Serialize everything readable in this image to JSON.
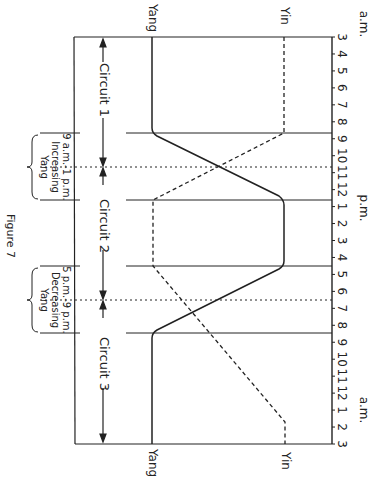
{
  "figure": {
    "caption": "Figure 7",
    "series": {
      "yang_label": "Yang",
      "yin_label": "Yin"
    },
    "axis": {
      "start_period": "a.m.",
      "mid_period": "p.m.",
      "end_period": "a.m.",
      "hour_ticks": [
        "3",
        "4",
        "5",
        "6",
        "7",
        "8",
        "9",
        "10",
        "11",
        "12",
        "1",
        "2",
        "3",
        "4",
        "5",
        "6",
        "7",
        "8",
        "9",
        "10",
        "11",
        "12",
        "1",
        "2",
        "3"
      ]
    },
    "circuits": [
      {
        "label": "Circuit 1",
        "from": "3 a.m.",
        "to": "11 a.m."
      },
      {
        "label": "Circuit 2",
        "from": "11 a.m.",
        "to": "7 p.m."
      },
      {
        "label": "Circuit 3",
        "from": "7 p.m.",
        "to": "3 a.m."
      }
    ],
    "transitions": [
      {
        "line1": "9 a.m.-1 p.m.",
        "line2": "Increasing",
        "line3": "Yang"
      },
      {
        "line1": "5 p.m.-9 p.m.",
        "line2": "Decreasing",
        "line3": "Yang"
      }
    ],
    "colors": {
      "ink": "#222222",
      "background": "#ffffff"
    }
  },
  "chart_data": {
    "type": "line",
    "title": "Figure 7",
    "orientation": "rotated 90° (time runs top-to-bottom)",
    "x": [
      "3 a.m.",
      "9 a.m.",
      "11 a.m.",
      "1 p.m.",
      "5 p.m.",
      "7 p.m.",
      "9 p.m.",
      "2 a.m.",
      "3 a.m."
    ],
    "series": [
      {
        "name": "Yang",
        "style": "solid",
        "values": [
          0,
          0,
          0.5,
          1,
          1,
          0.5,
          0,
          0,
          0
        ]
      },
      {
        "name": "Yin",
        "style": "dashed",
        "values": [
          1,
          1,
          0.5,
          0,
          0,
          0.16,
          0.31,
          1,
          1
        ]
      }
    ],
    "annotations": [
      "Circuit 1",
      "Circuit 2",
      "Circuit 3",
      "9 a.m.-1 p.m. Increasing Yang",
      "5 p.m.-9 p.m. Decreasing Yang"
    ]
  }
}
